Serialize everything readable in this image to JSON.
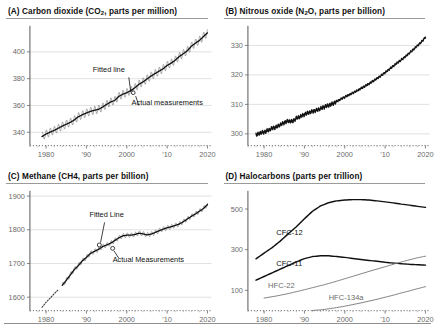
{
  "figure": {
    "background": "#ffffff",
    "ink": "#111111",
    "grid_color": "#d9d9d9"
  },
  "panels": {
    "a": {
      "title_prefix": "(A) Carbon dioxide (CO",
      "title_sub": "2",
      "title_suffix": ", parts per million)",
      "annotation_fitted": "Fitted line",
      "annotation_actual": "Actual measurements"
    },
    "b": {
      "title_prefix": "(B) Nitrous oxide (N",
      "title_sub": "2",
      "title_suffix": "O, parts per billion)"
    },
    "c": {
      "title": "(C) Methane (CH4, parts per billion)",
      "annotation_fitted": "Fitted Line",
      "annotation_actual": "Actual Measurements"
    },
    "d": {
      "title": "(D) Halocarbons (parts per trillion)"
    }
  },
  "chart_data": [
    {
      "id": "co2",
      "type": "line",
      "title": "(A) Carbon dioxide (CO2, parts per million)",
      "xlabel": "",
      "ylabel": "parts per million",
      "xlim": [
        1976,
        2021
      ],
      "ylim": [
        330,
        418
      ],
      "yticks": [
        340,
        360,
        380,
        400
      ],
      "ytick_labels": [
        "340",
        "360",
        "380",
        "400"
      ],
      "xticks": [
        1980,
        1990,
        2000,
        2010,
        2020
      ],
      "xtick_labels": [
        "1980",
        "'90",
        "2000",
        "'10",
        "2020"
      ],
      "grid": true,
      "legend": false,
      "annotations": [
        {
          "text": "Fitted line",
          "x": 2000,
          "y": 383
        },
        {
          "text": "Actual measurements",
          "x": 2004,
          "y": 358
        }
      ],
      "series": [
        {
          "name": "Fitted line",
          "x": [
            1979,
            1980,
            1981,
            1982,
            1983,
            1984,
            1985,
            1986,
            1987,
            1988,
            1989,
            1990,
            1991,
            1992,
            1993,
            1994,
            1995,
            1996,
            1997,
            1998,
            1999,
            2000,
            2001,
            2002,
            2003,
            2004,
            2005,
            2006,
            2007,
            2008,
            2009,
            2010,
            2011,
            2012,
            2013,
            2014,
            2015,
            2016,
            2017,
            2018,
            2019,
            2020
          ],
          "values": [
            336.8,
            338.7,
            340.1,
            341.4,
            343.0,
            344.6,
            346.0,
            347.4,
            349.2,
            351.6,
            353.1,
            354.4,
            355.6,
            356.4,
            357.1,
            358.8,
            360.8,
            362.6,
            363.7,
            366.7,
            368.4,
            369.5,
            371.1,
            373.2,
            375.8,
            377.5,
            379.8,
            381.9,
            383.8,
            385.6,
            387.4,
            389.9,
            391.6,
            393.8,
            396.5,
            398.6,
            400.8,
            404.2,
            406.5,
            408.5,
            411.4,
            414.2
          ]
        },
        {
          "name": "Actual measurements",
          "note": "monthly values with seasonal sawtooth, amplitude ~3 ppm"
        }
      ]
    },
    {
      "id": "n2o",
      "type": "line",
      "title": "(B) Nitrous oxide (N2O, parts per billion)",
      "xlabel": "",
      "ylabel": "parts per billion",
      "xlim": [
        1976,
        2021
      ],
      "ylim": [
        296,
        336
      ],
      "yticks": [
        300,
        310,
        320,
        330
      ],
      "ytick_labels": [
        "300",
        "310",
        "320",
        "330"
      ],
      "xticks": [
        1980,
        1990,
        2000,
        2010,
        2020
      ],
      "xtick_labels": [
        "1980",
        "'90",
        "2000",
        "'10",
        "2020"
      ],
      "grid": true,
      "legend": false,
      "series": [
        {
          "name": "N2O",
          "x": [
            1978,
            1979,
            1980,
            1981,
            1982,
            1983,
            1984,
            1985,
            1986,
            1987,
            1988,
            1989,
            1990,
            1991,
            1992,
            1993,
            1994,
            1995,
            1996,
            1997,
            1998,
            1999,
            2000,
            2001,
            2002,
            2003,
            2004,
            2005,
            2006,
            2007,
            2008,
            2009,
            2010,
            2011,
            2012,
            2013,
            2014,
            2015,
            2016,
            2017,
            2018,
            2019,
            2020
          ],
          "values": [
            299.6,
            300.3,
            300.6,
            301.2,
            301.9,
            302.3,
            303.1,
            303.8,
            304.4,
            304.2,
            305.3,
            305.9,
            306.6,
            307.2,
            307.6,
            308.0,
            308.6,
            309.2,
            309.7,
            310.2,
            311.0,
            311.8,
            312.5,
            313.2,
            313.9,
            314.6,
            315.4,
            316.2,
            317.0,
            317.9,
            318.8,
            319.8,
            320.8,
            321.9,
            323.0,
            324.1,
            325.1,
            326.2,
            327.4,
            328.6,
            329.9,
            331.2,
            332.8
          ]
        }
      ]
    },
    {
      "id": "ch4",
      "type": "line",
      "title": "(C) Methane (CH4, parts per billion)",
      "xlabel": "",
      "ylabel": "parts per billion",
      "xlim": [
        1976,
        2021
      ],
      "ylim": [
        1560,
        1910
      ],
      "yticks": [
        1600,
        1700,
        1800,
        1900
      ],
      "ytick_labels": [
        "1600",
        "1700",
        "1800",
        "1900"
      ],
      "xticks": [
        1980,
        1990,
        2000,
        2010,
        2020
      ],
      "xtick_labels": [
        "1980",
        "'90",
        "2000",
        "'10",
        "2020"
      ],
      "grid": true,
      "legend": false,
      "annotations": [
        {
          "text": "Fitted Line",
          "x": 1995,
          "y": 1830
        },
        {
          "text": "Actual Measurements",
          "x": 2001,
          "y": 1712
        }
      ],
      "series": [
        {
          "name": "Ice core / early record (dotted)",
          "x": [
            1979,
            1980,
            1981,
            1982,
            1983
          ],
          "values": [
            1570,
            1585,
            1597,
            1610,
            1622
          ]
        },
        {
          "name": "Fitted Line",
          "x": [
            1984,
            1985,
            1986,
            1987,
            1988,
            1989,
            1990,
            1991,
            1992,
            1993,
            1994,
            1995,
            1996,
            1997,
            1998,
            1999,
            2000,
            2001,
            2002,
            2003,
            2004,
            2005,
            2006,
            2007,
            2008,
            2009,
            2010,
            2011,
            2012,
            2013,
            2014,
            2015,
            2016,
            2017,
            2018,
            2019,
            2020
          ],
          "values": [
            1635,
            1650,
            1666,
            1682,
            1694,
            1708,
            1718,
            1730,
            1736,
            1742,
            1750,
            1755,
            1760,
            1768,
            1776,
            1782,
            1784,
            1784,
            1786,
            1790,
            1788,
            1785,
            1787,
            1792,
            1797,
            1802,
            1806,
            1809,
            1813,
            1817,
            1824,
            1832,
            1840,
            1847,
            1855,
            1863,
            1875
          ]
        }
      ]
    },
    {
      "id": "halocarbons",
      "type": "line",
      "title": "(D) Halocarbons (parts per trillion)",
      "xlabel": "",
      "ylabel": "parts per trillion",
      "xlim": [
        1976,
        2021
      ],
      "ylim": [
        0,
        580
      ],
      "yticks": [
        100,
        300,
        500
      ],
      "ytick_labels": [
        "100",
        "300",
        "500"
      ],
      "xticks": [
        1980,
        1990,
        2000,
        2010,
        2020
      ],
      "xtick_labels": [
        "1980",
        "'90",
        "2000",
        "'10",
        "2020"
      ],
      "grid": false,
      "legend": true,
      "legend_position": "inline-labels",
      "series": [
        {
          "name": "CFC-12",
          "style": "strong",
          "label_x": 1983,
          "label_y": 370,
          "x": [
            1978,
            1980,
            1982,
            1984,
            1986,
            1988,
            1990,
            1992,
            1994,
            1996,
            1998,
            2000,
            2002,
            2004,
            2006,
            2008,
            2010,
            2012,
            2014,
            2016,
            2018,
            2020
          ],
          "values": [
            255,
            283,
            310,
            342,
            378,
            413,
            452,
            489,
            515,
            531,
            540,
            544,
            546,
            546,
            544,
            540,
            535,
            530,
            524,
            519,
            513,
            508
          ]
        },
        {
          "name": "CFC-11",
          "style": "strong",
          "label_x": 1983,
          "label_y": 218,
          "x": [
            1978,
            1980,
            1982,
            1984,
            1986,
            1988,
            1990,
            1992,
            1994,
            1996,
            1998,
            2000,
            2002,
            2004,
            2006,
            2008,
            2010,
            2012,
            2014,
            2016,
            2018,
            2020
          ],
          "values": [
            150,
            168,
            186,
            204,
            222,
            240,
            256,
            266,
            270,
            270,
            266,
            262,
            257,
            252,
            247,
            243,
            238,
            234,
            231,
            228,
            226,
            224
          ]
        },
        {
          "name": "HFC-22",
          "style": "light",
          "label_x": 1981,
          "label_y": 110,
          "x": [
            1980,
            1983,
            1986,
            1989,
            1992,
            1995,
            1998,
            2001,
            2004,
            2007,
            2010,
            2013,
            2016,
            2018,
            2020
          ],
          "values": [
            62,
            72,
            84,
            98,
            113,
            128,
            145,
            163,
            181,
            199,
            216,
            234,
            250,
            260,
            268
          ]
        },
        {
          "name": "HFC-134a",
          "style": "light",
          "label_x": 1996,
          "label_y": 52,
          "x": [
            1992,
            1994,
            1996,
            1998,
            2000,
            2002,
            2004,
            2006,
            2008,
            2010,
            2012,
            2014,
            2016,
            2018,
            2020
          ],
          "values": [
            1,
            4,
            9,
            15,
            22,
            30,
            38,
            47,
            56,
            66,
            76,
            87,
            97,
            108,
            118
          ]
        }
      ]
    }
  ]
}
